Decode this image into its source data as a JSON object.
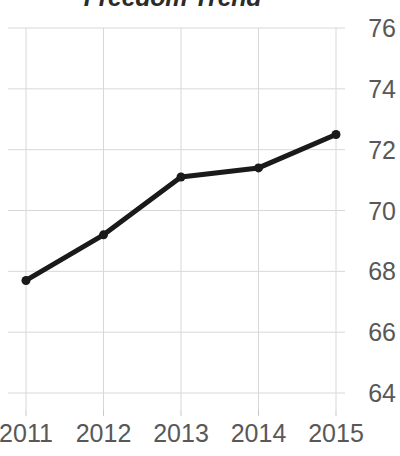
{
  "chart_data": {
    "type": "line",
    "title": "Freedom Trend",
    "xlabel": "",
    "ylabel": "",
    "categories": [
      "2011",
      "2012",
      "2013",
      "2014",
      "2015"
    ],
    "x": [
      2011,
      2012,
      2013,
      2014,
      2015
    ],
    "values": [
      67.7,
      69.2,
      71.1,
      71.4,
      72.5
    ],
    "series": [
      {
        "name": "Freedom Trend",
        "values": [
          67.7,
          69.2,
          71.1,
          71.4,
          72.5
        ]
      }
    ],
    "ylim": [
      63.4,
      76.6
    ],
    "y_ticks": [
      76,
      74,
      72,
      70,
      68,
      66,
      64
    ],
    "y_tick_labels": [
      "76",
      "74",
      "72",
      "70",
      "68",
      "66",
      "64"
    ],
    "x_tick_labels": [
      "2011",
      "2012",
      "2013",
      "2014",
      "2015"
    ],
    "grid": true,
    "grid_axis": "both",
    "legend": false,
    "legend_position": "none",
    "y_axis_side": "right",
    "line_color": "#1a1a1a",
    "marker_color": "#1a1a1a",
    "grid_color": "#d8d8d8",
    "tick_label_color": "#585858",
    "title_color": "#2b2b2b",
    "background_color": "#ffffff",
    "marker": "circle",
    "line_width": 5,
    "marker_size": 9
  }
}
